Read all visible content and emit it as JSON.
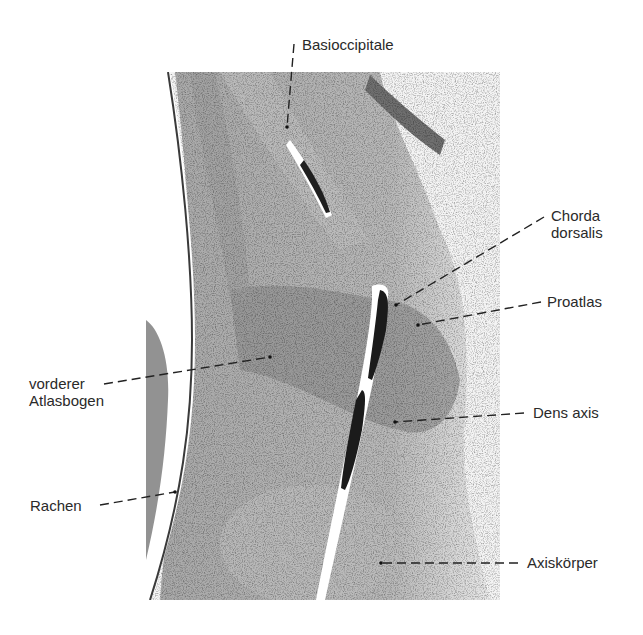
{
  "figure": {
    "type": "histology-micrograph",
    "micrograph_bounds": {
      "x": 146,
      "y": 72,
      "width": 354,
      "height": 528
    },
    "colors": {
      "background": "#ffffff",
      "tissue_light": "#c9c9c9",
      "tissue_mid": "#a9a9a9",
      "tissue_dark": "#7a7a7a",
      "chorda": "#1e1e1e",
      "label_text": "#2a2a2a",
      "leader_line": "#222222"
    }
  },
  "labels": [
    {
      "id": "basioccipitale",
      "lines": [
        "Basioccipitale"
      ],
      "x": 302,
      "y": 36,
      "align": "left",
      "leader": {
        "x1": 294,
        "y1": 44,
        "x2": 287,
        "y2": 127
      }
    },
    {
      "id": "chorda-dorsalis",
      "lines": [
        "Chorda",
        "dorsalis"
      ],
      "x": 551,
      "y": 207,
      "align": "left",
      "leader": {
        "x1": 544,
        "y1": 217,
        "x2": 396,
        "y2": 305
      }
    },
    {
      "id": "proatlas",
      "lines": [
        "Proatlas"
      ],
      "x": 547,
      "y": 290,
      "align": "left",
      "leader": {
        "x1": 541,
        "y1": 302,
        "x2": 418,
        "y2": 325
      }
    },
    {
      "id": "vorderer-atlasbogen",
      "lines": [
        "vorderer",
        "Atlasbogen"
      ],
      "x": 29,
      "y": 374,
      "align": "left",
      "leader": {
        "x1": 104,
        "y1": 384,
        "x2": 270,
        "y2": 357
      }
    },
    {
      "id": "dens-axis",
      "lines": [
        "Dens axis"
      ],
      "x": 533,
      "y": 404,
      "align": "left",
      "leader": {
        "x1": 524,
        "y1": 413,
        "x2": 395,
        "y2": 422
      }
    },
    {
      "id": "rachen",
      "lines": [
        "Rachen"
      ],
      "x": 30,
      "y": 497,
      "align": "left",
      "leader": {
        "x1": 100,
        "y1": 505,
        "x2": 175,
        "y2": 492
      }
    },
    {
      "id": "axiskoerper",
      "lines": [
        "Axiskörper"
      ],
      "x": 527,
      "y": 555,
      "align": "left",
      "leader": {
        "x1": 518,
        "y1": 563,
        "x2": 381,
        "y2": 563
      }
    }
  ]
}
